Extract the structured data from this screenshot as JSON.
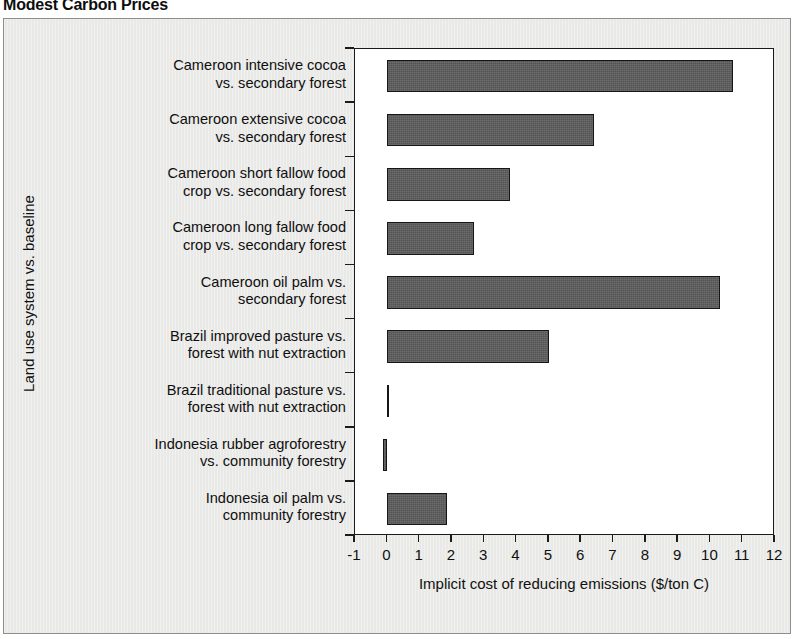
{
  "figure": {
    "title": "Modest Carbon Prices",
    "background_color": "#e9e9e7",
    "plot_background_color": "#ffffff",
    "bar_color": "#5b5b5b",
    "bar_border_color": "#161616",
    "frame_color": "#8e8e8e"
  },
  "chart_data": {
    "type": "bar",
    "orientation": "horizontal",
    "title": "Modest Carbon Prices",
    "xlabel": "Implicit cost of reducing emissions ($/ton C)",
    "ylabel": "Land use system vs. baseline",
    "xlim": [
      -1,
      12
    ],
    "xticks": [
      -1,
      0,
      1,
      2,
      3,
      4,
      5,
      6,
      7,
      8,
      9,
      10,
      11,
      12
    ],
    "xtick_labels": [
      "-1",
      "0",
      "1",
      "2",
      "3",
      "4",
      "5",
      "6",
      "7",
      "8",
      "9",
      "10",
      "11",
      "12"
    ],
    "grid": false,
    "legend": false,
    "categories": [
      "Cameroon intensive cocoa\nvs. secondary forest",
      "Cameroon extensive cocoa\nvs. secondary forest",
      "Cameroon short fallow food\ncrop vs. secondary forest",
      "Cameroon long fallow food\ncrop vs. secondary forest",
      "Cameroon oil palm vs.\nsecondary forest",
      "Brazil improved pasture vs.\nforest with nut extraction",
      "Brazil traditional pasture vs.\nforest with nut extraction",
      "Indonesia rubber agroforestry\nvs. community forestry",
      "Indonesia oil palm vs.\ncommunity forestry"
    ],
    "values": [
      10.7,
      6.4,
      3.8,
      2.7,
      10.3,
      5.0,
      0.03,
      -0.15,
      1.85
    ]
  }
}
